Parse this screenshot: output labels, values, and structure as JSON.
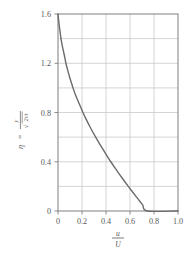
{
  "chart_data": {
    "type": "line",
    "title": "",
    "subtitle": "",
    "xlabel": "u/U",
    "xlabel_numerator": "u",
    "xlabel_denominator": "U",
    "ylabel": "η = y / √(2νt)",
    "ylabel_symbol": "η",
    "ylabel_equals": "=",
    "ylabel_numerator": "y",
    "ylabel_denominator_radical": "√",
    "ylabel_denominator": "2νt",
    "xlim": [
      0,
      1.0
    ],
    "ylim": [
      0,
      1.6
    ],
    "xticks": [
      0,
      0.2,
      0.4,
      0.6,
      0.8,
      1.0
    ],
    "xtick_labels": [
      "0",
      "0.2",
      "0.4",
      "0.6",
      "0.8",
      "1.0"
    ],
    "yticks": [
      0,
      0.4,
      0.8,
      1.2,
      1.6
    ],
    "ytick_labels": [
      "0",
      "0.4",
      "0.8",
      "1.2",
      "1.6"
    ],
    "grid": true,
    "grid_x_values": [
      0.2,
      0.4,
      0.6,
      0.8
    ],
    "grid_y_values": [
      0.2,
      0.4,
      0.6,
      0.8,
      1.0,
      1.2,
      1.4
    ],
    "legend": null,
    "legend_position": "none",
    "series": [
      {
        "name": "u/U = erfc(η)",
        "x": [
          0.0,
          0.005,
          0.011,
          0.018,
          0.025,
          0.034,
          0.045,
          0.056,
          0.066,
          0.079,
          0.093,
          0.109,
          0.125,
          0.143,
          0.164,
          0.186,
          0.208,
          0.232,
          0.258,
          0.285,
          0.314,
          0.344,
          0.375,
          0.407,
          0.44,
          0.475,
          0.511,
          0.548,
          0.586,
          0.625,
          0.665,
          0.705,
          0.746,
          0.787,
          0.829,
          0.871,
          0.914,
          0.957,
          1.0
        ],
        "y": [
          1.6,
          1.55,
          1.5,
          1.45,
          1.4,
          1.35,
          1.3,
          1.25,
          1.2,
          1.15,
          1.1,
          1.05,
          1.0,
          0.95,
          0.9,
          0.85,
          0.8,
          0.75,
          0.7,
          0.65,
          0.6,
          0.55,
          0.5,
          0.45,
          0.4,
          0.35,
          0.3,
          0.25,
          0.2,
          0.15,
          0.1,
          0.05,
          0.0,
          0.0,
          0.0,
          0.0,
          0.0,
          0.0,
          0.0
        ],
        "color": "#6b6b6b",
        "width": 1.4
      }
    ]
  },
  "style": {
    "background": "#ffffff",
    "frame_color": "#8a8a8a",
    "grid_color": "#c9c9c9",
    "curve_color": "#6b6b6b",
    "text_color": "#5a5a5a"
  }
}
